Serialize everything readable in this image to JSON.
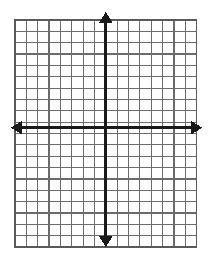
{
  "figure": {
    "type": "coordinate-grid",
    "background_color": "#ffffff"
  },
  "chart_data": {
    "type": "scatter",
    "title": "",
    "subtitle": "",
    "xlabel": "",
    "ylabel": "",
    "x": [],
    "y": [],
    "series": [],
    "annotations": [],
    "legend": [],
    "legend_position": "none",
    "grid": true,
    "xlim": [
      -8,
      8
    ],
    "ylim": [
      -10,
      10
    ],
    "xtick_labels": [],
    "ytick_labels": []
  },
  "grid": {
    "columns": 16,
    "rows": 20,
    "cell_size_px": 11.35,
    "left_px": 15,
    "top_px": 20,
    "width_px": 181.6,
    "height_px": 227,
    "line_color": "#6b6b6b",
    "line_width_px": 1.2,
    "border_color": "#5a5a5a",
    "border_width_px": 1.6
  },
  "axes": {
    "color": "#1a1a1a",
    "line_width_px": 3,
    "origin_x_px": 105.8,
    "origin_y_px": 127.7,
    "x_axis": {
      "label": "x-axis",
      "start_px": 11,
      "end_px": 202,
      "arrow_start": true,
      "arrow_end": true
    },
    "y_axis": {
      "label": "y-axis",
      "start_px": 12,
      "end_px": 247,
      "arrow_start": true,
      "arrow_end": true
    },
    "arrow_head": {
      "length_px": 11,
      "half_width_px": 7
    }
  }
}
